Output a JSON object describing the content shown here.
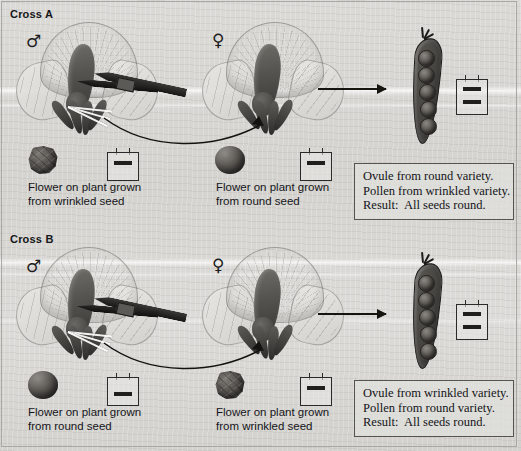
{
  "figure": {
    "background_color": "#d8d7d4",
    "frame_color": "#a9a8a4"
  },
  "panels": [
    {
      "id": "cross-a",
      "title": "Cross A",
      "male": {
        "symbol": "♂",
        "seed_type": "wrinkled",
        "caption": "Flower on plant grown\nfrom wrinkled seed",
        "tag_bars": 1
      },
      "female": {
        "symbol": "♀",
        "seed_type": "round",
        "caption": "Flower on plant grown\nfrom round seed",
        "tag_bars": 1
      },
      "pod": {
        "pea_count": 5,
        "pea_type": "round",
        "tag_bars": 2
      },
      "result": {
        "line1": "Ovule from round variety.",
        "line2": "Pollen from wrinkled variety.",
        "line3": "Result:  All seeds round."
      }
    },
    {
      "id": "cross-b",
      "title": "Cross B",
      "male": {
        "symbol": "♂",
        "seed_type": "round",
        "caption": "Flower on plant grown\nfrom round seed",
        "tag_bars": 1
      },
      "female": {
        "symbol": "♀",
        "seed_type": "wrinkled",
        "caption": "Flower on plant grown\nfrom wrinkled seed",
        "tag_bars": 1
      },
      "pod": {
        "pea_count": 5,
        "pea_type": "round",
        "tag_bars": 2
      },
      "result": {
        "line1": "Ovule from wrinkled variety.",
        "line2": "Pollen from round variety.",
        "line3": "Result:  All seeds round."
      }
    }
  ]
}
